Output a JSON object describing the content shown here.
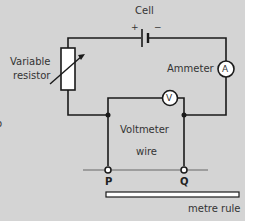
{
  "diagram": {
    "labels": {
      "cell": "Cell",
      "plus": "+",
      "minus": "−",
      "variable_resistor_line1": "Variable",
      "variable_resistor_line2": "resistor",
      "ammeter": "Ammeter",
      "ammeter_symbol": "A",
      "voltmeter_symbol": "V",
      "voltmeter": "Voltmeter",
      "wire": "wire",
      "point_p": "P",
      "point_q": "Q",
      "metre_rule": "metre rule",
      "left_fragment": "o"
    },
    "colors": {
      "background": "#d4d4d4",
      "line": "#1a1a1a",
      "wire_line": "#666666",
      "fill": "#ffffff"
    }
  }
}
